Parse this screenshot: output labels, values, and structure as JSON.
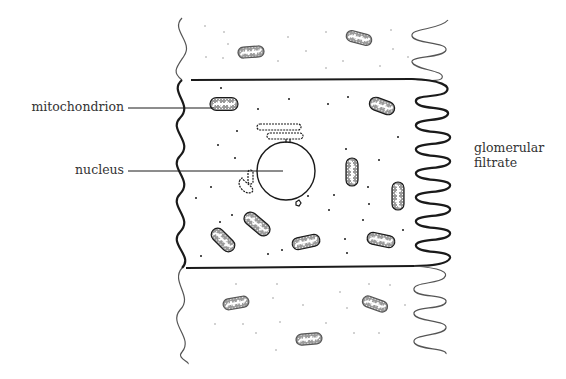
{
  "diagram": {
    "type": "kidney tubule epithelial cell (labeled)",
    "labels": {
      "mitochondrion": "mitochondrion",
      "nucleus": "nucleus",
      "filtrate_line1": "glomerular",
      "filtrate_line2": "filtrate"
    },
    "colors": {
      "ink": "#1a1a1a",
      "faint_ink": "#555555",
      "text": "#333333",
      "background": "#ffffff"
    },
    "cell_bounds": {
      "top": 80,
      "bottom": 268,
      "left": 180,
      "right": 412
    },
    "nucleus": {
      "cx": 286,
      "cy": 171,
      "r": 29
    },
    "mitochondria_in_cell": [
      {
        "x": 224,
        "y": 104,
        "w": 28,
        "h": 13,
        "rot": 0
      },
      {
        "x": 382,
        "y": 106,
        "w": 26,
        "h": 13,
        "rot": 20
      },
      {
        "x": 352,
        "y": 172,
        "w": 28,
        "h": 12,
        "rot": 90
      },
      {
        "x": 398,
        "y": 196,
        "w": 28,
        "h": 12,
        "rot": 90
      },
      {
        "x": 223,
        "y": 240,
        "w": 28,
        "h": 13,
        "rot": 45
      },
      {
        "x": 257,
        "y": 224,
        "w": 30,
        "h": 13,
        "rot": 40
      },
      {
        "x": 306,
        "y": 242,
        "w": 28,
        "h": 12,
        "rot": -12
      },
      {
        "x": 381,
        "y": 240,
        "w": 28,
        "h": 12,
        "rot": 12
      }
    ],
    "mitochondria_outside": [
      {
        "x": 251,
        "y": 52,
        "w": 26,
        "h": 11,
        "rot": -4
      },
      {
        "x": 359,
        "y": 38,
        "w": 26,
        "h": 11,
        "rot": 15
      },
      {
        "x": 236,
        "y": 303,
        "w": 26,
        "h": 11,
        "rot": -10
      },
      {
        "x": 375,
        "y": 304,
        "w": 26,
        "h": 11,
        "rot": 20
      },
      {
        "x": 309,
        "y": 339,
        "w": 26,
        "h": 11,
        "rot": -5
      }
    ]
  }
}
